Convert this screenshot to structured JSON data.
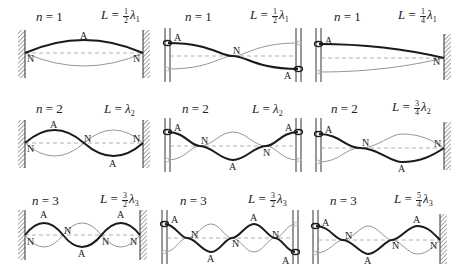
{
  "figure": {
    "columns": [
      {
        "boundary": "fixed-fixed"
      },
      {
        "boundary": "free-free"
      },
      {
        "boundary": "free-fixed"
      }
    ],
    "rows": [
      {
        "n_label": "n = 1",
        "panels": [
          {
            "n": "n",
            "eq": "=",
            "n_val": "1",
            "L": "L",
            "Leq": "=",
            "frac_num": "1",
            "frac_den": "2",
            "lambda": "λ",
            "sub": "1",
            "markers": [
              "A",
              "N",
              "N"
            ]
          },
          {
            "n": "n",
            "eq": "=",
            "n_val": "1",
            "L": "L",
            "Leq": "=",
            "frac_num": "1",
            "frac_den": "2",
            "lambda": "λ",
            "sub": "1",
            "markers": [
              "A",
              "N",
              "A"
            ]
          },
          {
            "n": "n",
            "eq": "=",
            "n_val": "1",
            "L": "L",
            "Leq": "=",
            "frac_num": "1",
            "frac_den": "4",
            "lambda": "λ",
            "sub": "1",
            "markers": [
              "A",
              "N"
            ]
          }
        ]
      },
      {
        "n_label": "n = 2",
        "panels": [
          {
            "n": "n",
            "eq": "=",
            "n_val": "2",
            "L": "L",
            "Leq": "=",
            "frac_num": "",
            "frac_den": "",
            "lambda": "λ",
            "sub": "2",
            "markers": [
              "A",
              "N",
              "N",
              "N",
              "A"
            ]
          },
          {
            "n": "n",
            "eq": "=",
            "n_val": "2",
            "L": "L",
            "Leq": "=",
            "frac_num": "",
            "frac_den": "",
            "lambda": "λ",
            "sub": "2",
            "markers": [
              "A",
              "N",
              "A",
              "N",
              "A"
            ]
          },
          {
            "n": "n",
            "eq": "=",
            "n_val": "2",
            "L": "L",
            "Leq": "=",
            "frac_num": "3",
            "frac_den": "4",
            "lambda": "λ",
            "sub": "2",
            "markers": [
              "A",
              "N",
              "A",
              "N"
            ]
          }
        ]
      },
      {
        "n_label": "n = 3",
        "panels": [
          {
            "n": "n",
            "eq": "=",
            "n_val": "3",
            "L": "L",
            "Leq": "=",
            "frac_num": "3",
            "frac_den": "2",
            "lambda": "λ",
            "sub": "3",
            "markers": [
              "A",
              "N",
              "N",
              "A",
              "N",
              "A",
              "N"
            ]
          },
          {
            "n": "n",
            "eq": "=",
            "n_val": "3",
            "L": "L",
            "Leq": "=",
            "frac_num": "3",
            "frac_den": "2",
            "lambda": "λ",
            "sub": "3",
            "markers": [
              "A",
              "N",
              "A",
              "N",
              "A",
              "N",
              "A"
            ]
          },
          {
            "n": "n",
            "eq": "=",
            "n_val": "3",
            "L": "L",
            "Leq": "=",
            "frac_num": "5",
            "frac_den": "4",
            "lambda": "λ",
            "sub": "3",
            "markers": [
              "A",
              "N",
              "A",
              "N",
              "A",
              "N"
            ]
          }
        ]
      }
    ],
    "legend": {
      "antinode_symbol": "A",
      "node_symbol": "N"
    },
    "colors": {
      "stroke_main": "#1a1a1a",
      "stroke_ghost": "#8a8a8a",
      "axis_dash": "#a0a0a0",
      "hatch": "#333333"
    }
  }
}
